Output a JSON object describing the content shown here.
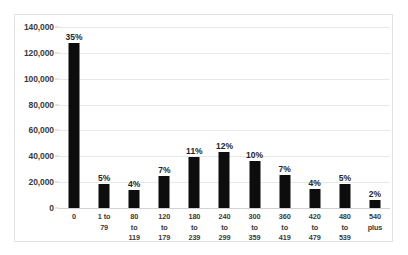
{
  "chart_data": {
    "type": "bar",
    "title": "",
    "subtitle": "",
    "xlabel": "",
    "ylabel": "",
    "grid": true,
    "legend": false,
    "ylim": [
      0,
      140000
    ],
    "ytick_values": [
      0,
      20000,
      40000,
      60000,
      80000,
      100000,
      120000,
      140000
    ],
    "ytick_labels": [
      "0",
      "20,000",
      "40,000",
      "60,000",
      "80,000",
      "100,000",
      "120,000",
      "140,000"
    ],
    "categories": [
      "0",
      "1 to 79",
      "80 to\n119",
      "120 to\n179",
      "180 to\n239",
      "240 to\n299",
      "300 to\n359",
      "360 to\n419",
      "420 to\n479",
      "480 to\n539",
      "540\nplus"
    ],
    "values": [
      127600,
      18500,
      13900,
      25100,
      39500,
      43000,
      36700,
      25900,
      14700,
      18500,
      6200
    ],
    "data_labels": [
      "35%",
      "5%",
      "4%",
      "7%",
      "11%",
      "12%",
      "10%",
      "7%",
      "4%",
      "5%",
      "2%"
    ],
    "bar_color": "#0d0d0d",
    "grid_color": "#e8e8e8",
    "background_color": "#ffffff",
    "border_color": "#e2e2e2"
  }
}
